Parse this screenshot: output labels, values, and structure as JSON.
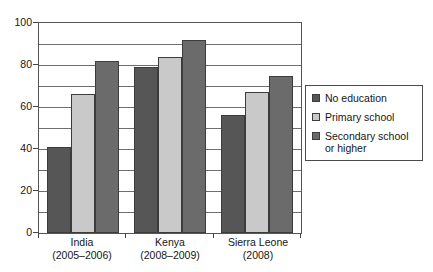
{
  "chart_data": {
    "type": "bar",
    "title": "",
    "xlabel": "",
    "ylabel": "",
    "ylim": [
      0,
      100
    ],
    "grid": true,
    "legend_position": "right",
    "categories": [
      "India\n(2005–2006)",
      "Kenya\n(2008–2009)",
      "Sierra Leone\n(2008)"
    ],
    "category_lines": [
      {
        "name": "India",
        "period": "(2005–2006)"
      },
      {
        "name": "Kenya",
        "period": "(2008–2009)"
      },
      {
        "name": "Sierra Leone",
        "period": "(2008)"
      }
    ],
    "series": [
      {
        "name": "No education",
        "color": "#565656",
        "values": [
          41,
          79,
          56
        ]
      },
      {
        "name": "Primary school",
        "color": "#c9c9c9",
        "values": [
          66,
          84,
          67
        ]
      },
      {
        "name": "Secondary school or higher",
        "color": "#6b6b6b",
        "values": [
          82,
          92,
          75
        ]
      }
    ],
    "ytick_labels": [
      "0",
      "20",
      "40",
      "60",
      "80",
      "100"
    ],
    "ytick_values": [
      0,
      20,
      40,
      60,
      80,
      100
    ],
    "gridline_values": [
      10,
      20,
      30,
      40,
      50,
      60,
      70,
      80,
      90,
      100
    ]
  },
  "legend": {
    "items": [
      {
        "label": "No education"
      },
      {
        "label": "Primary school"
      },
      {
        "label": "Secondary school or higher"
      }
    ]
  }
}
